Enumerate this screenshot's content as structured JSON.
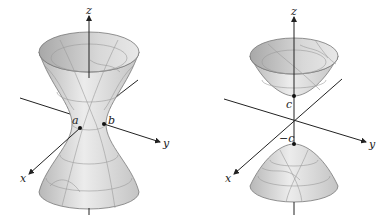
{
  "figures": [
    {
      "name": "hyperboloid-one-sheet",
      "axes": {
        "z": "z",
        "y": "y",
        "x": "x"
      },
      "points": [
        {
          "label": "a"
        },
        {
          "label": "b"
        }
      ]
    },
    {
      "name": "hyperboloid-two-sheets",
      "axes": {
        "z": "z",
        "y": "y",
        "x": "x"
      },
      "points": [
        {
          "label": "c"
        },
        {
          "label": "−c"
        }
      ]
    }
  ],
  "colors": {
    "surface_light": "#e6e6e6",
    "surface_dark": "#b4b4b4",
    "grid": "#9a9a9a",
    "axis": "#222222"
  }
}
